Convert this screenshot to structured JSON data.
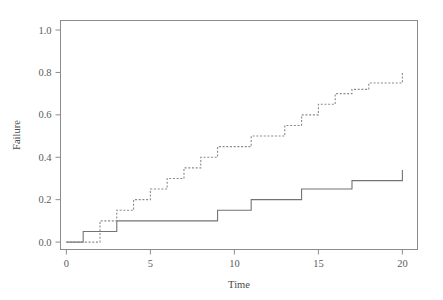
{
  "chart_data": {
    "type": "line",
    "title": "",
    "subtitle": "",
    "xlabel": "Time",
    "ylabel": "Failure",
    "xlim": [
      -0.35,
      20.9
    ],
    "ylim": [
      -0.035,
      1.045
    ],
    "xticks": [
      0,
      5,
      10,
      15,
      20
    ],
    "xticklabels": [
      "0",
      "5",
      "10",
      "15",
      "20"
    ],
    "yticks": [
      0.0,
      0.2,
      0.4,
      0.6,
      0.8,
      1.0
    ],
    "yticklabels": [
      "0.0",
      "0.2",
      "0.4",
      "0.6",
      "0.8",
      "1.0"
    ],
    "grid": false,
    "legend": null,
    "legend_position": "none",
    "step_style": "post",
    "series": [
      {
        "name": "solid-step-curve",
        "linestyle": "solid",
        "color": "#737373",
        "linewidth": 1.1,
        "x": [
          0,
          1,
          3,
          9,
          11,
          14,
          17,
          20
        ],
        "y": [
          0.0,
          0.05,
          0.1,
          0.15,
          0.2,
          0.25,
          0.29,
          0.34
        ]
      },
      {
        "name": "dashed-step-curve",
        "linestyle": "dotted",
        "color": "#8a8a8a",
        "linewidth": 1.1,
        "x": [
          0,
          2,
          3,
          4,
          5,
          6,
          7,
          8,
          9,
          11,
          13,
          14,
          15,
          16,
          17,
          18,
          20
        ],
        "y": [
          0.0,
          0.1,
          0.15,
          0.2,
          0.25,
          0.3,
          0.35,
          0.4,
          0.45,
          0.5,
          0.55,
          0.6,
          0.65,
          0.7,
          0.72,
          0.75,
          0.8
        ]
      }
    ]
  },
  "axis_labels": {
    "x": "Time",
    "y": "Failure"
  },
  "style": {
    "frame_color": "#8c8c8c",
    "tick_color": "#8c8c8c",
    "text_color": "#4a4a4a",
    "background": "#ffffff"
  }
}
